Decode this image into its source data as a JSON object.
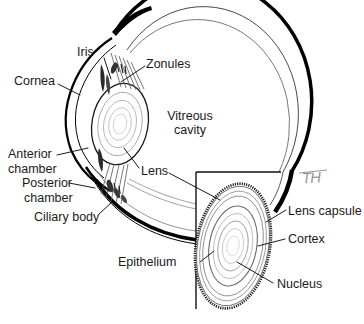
{
  "figure": {
    "background_color": "#ffffff",
    "line_color": "#000000",
    "ring_color": "#9a9a9a",
    "signature_color": "#9d9391",
    "labels": {
      "iris": "Iris",
      "zonules": "Zonules",
      "cornea": "Cornea",
      "vitreous": {
        "line1": "Vitreous",
        "line2": "cavity"
      },
      "anterior_chamber": {
        "line1": "Anterior",
        "line2": "chamber"
      },
      "posterior_chamber": {
        "line1": "Posterior",
        "line2": "chamber"
      },
      "ciliary_body": "Ciliary body",
      "lens": "Lens",
      "epithelium": "Epithelium",
      "lens_capsule": "Lens capsule",
      "cortex": "Cortex",
      "nucleus": "Nucleus",
      "signature": "TH"
    }
  }
}
